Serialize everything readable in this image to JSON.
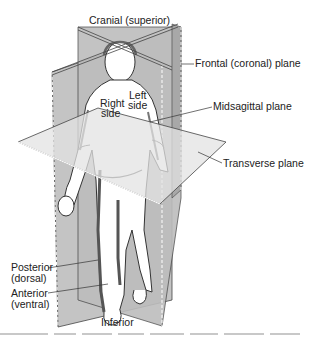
{
  "figure": {
    "labels": {
      "cranial": "Cranial (superior)",
      "frontal_plane": "Frontal (coronal) plane",
      "midsagittal_plane": "Midsagittal plane",
      "transverse_plane": "Transverse plane",
      "right_side_1": "Right",
      "right_side_2": "side",
      "left_side_1": "Left",
      "left_side_2": "side",
      "posterior_1": "Posterior",
      "posterior_2": "(dorsal)",
      "anterior_1": "Anterior",
      "anterior_2": "(ventral)",
      "inferior": "Inferior"
    },
    "colors": {
      "plane_dark": "#b9b9b9",
      "plane_mid": "#cfcfcf",
      "plane_light": "#e6e6e6",
      "outline": "#333333",
      "body_fill": "#ffffff",
      "stripe": "#555555"
    }
  }
}
